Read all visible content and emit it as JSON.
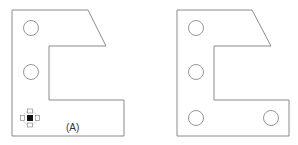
{
  "figure": {
    "panels": [
      {
        "id": "A",
        "label": "(A)",
        "outline_points": "12,10 88,10 106,46 49,46 49,100 124,100 124,136 12,136",
        "holes": [
          {
            "cx": 31,
            "cy": 28,
            "r": 7.5
          },
          {
            "cx": 31,
            "cy": 72,
            "r": 7.5
          }
        ],
        "move_handle": {
          "cx": 30,
          "cy": 118,
          "icon": "move-handle-icon"
        }
      },
      {
        "id": "B",
        "label": "",
        "outline_points": "177,10 252,10 271,46 214,46 214,100 289,100 289,136 177,136",
        "holes": [
          {
            "cx": 196,
            "cy": 28,
            "r": 7.5
          },
          {
            "cx": 196,
            "cy": 72,
            "r": 7.5
          },
          {
            "cx": 196,
            "cy": 118,
            "r": 7.5
          },
          {
            "cx": 271,
            "cy": 118,
            "r": 7.5
          }
        ]
      }
    ],
    "colors": {
      "stroke": "#8a8a8a",
      "background": "#ffffff",
      "handle_center": "#111111"
    }
  }
}
